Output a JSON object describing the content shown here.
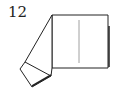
{
  "diagram": {
    "step_number": "12",
    "line_color": "#222222",
    "crease_color": "#888888"
  }
}
